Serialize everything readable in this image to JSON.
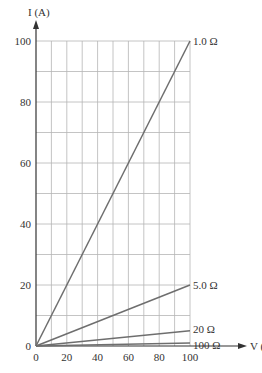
{
  "chart_data": {
    "type": "line",
    "title": "",
    "xlabel": "V (V)",
    "ylabel": "I (A)",
    "xlim": [
      0,
      100
    ],
    "ylim": [
      0,
      100
    ],
    "grid": true,
    "grid_step": {
      "x": 10,
      "y": 10
    },
    "x_ticks": [
      0,
      20,
      40,
      60,
      80,
      100
    ],
    "y_ticks": [
      0,
      20,
      40,
      60,
      80,
      100
    ],
    "x_tick_labels": [
      "0",
      "20",
      "40",
      "60",
      "80",
      "100"
    ],
    "y_tick_labels": [
      "0",
      "20",
      "40",
      "60",
      "80",
      "100"
    ],
    "series": [
      {
        "name": "1.0 Ω",
        "resistance": 1.0,
        "x": [
          0,
          100
        ],
        "values": [
          0,
          100
        ]
      },
      {
        "name": "5.0 Ω",
        "resistance": 5.0,
        "x": [
          0,
          100
        ],
        "values": [
          0,
          20
        ]
      },
      {
        "name": "20 Ω",
        "resistance": 20,
        "x": [
          0,
          100
        ],
        "values": [
          0,
          5
        ]
      },
      {
        "name": "100 Ω",
        "resistance": 100,
        "x": [
          0,
          100
        ],
        "values": [
          0,
          1
        ]
      }
    ],
    "legend_position": "line-end labels",
    "colors": {
      "grid": "#b5b5b5",
      "line": "#6e6e6e",
      "axis": "#333333",
      "text": "#333333"
    }
  }
}
